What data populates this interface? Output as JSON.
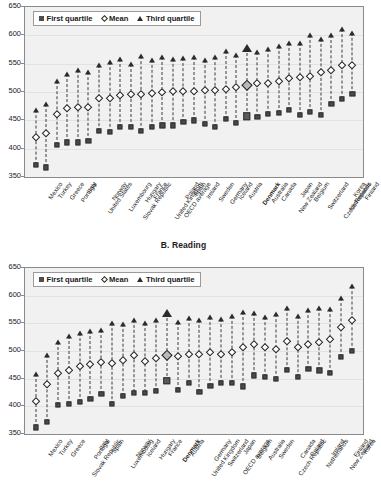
{
  "legend": {
    "first_quartile": "First quartile",
    "mean": "Mean",
    "third_quartile": "Third quartile"
  },
  "axis": {
    "ticks": [
      350,
      400,
      450,
      500,
      550,
      600,
      650
    ],
    "min": 350,
    "max": 650
  },
  "highlight_country": "Denmark",
  "chart_data": [
    {
      "type": "scatter",
      "title": "",
      "panel": "A",
      "xlabel": "",
      "ylabel": "",
      "ylim": [
        350,
        650
      ],
      "grid": true,
      "legend_position": "top-left",
      "categories": [
        "Mexico",
        "Turkey",
        "Greece",
        "Portugal",
        "Italy",
        "United States",
        "Norway",
        "Luxembourg",
        "Slovak Republic",
        "Hungary",
        "France",
        "United Kingdom",
        "OECD average",
        "Poland",
        "Spain",
        "Ireland",
        "Sweden",
        "Germany",
        "Iceland",
        "Austria",
        "Denmark",
        "Australia",
        "Canada",
        "New Zealand",
        "Japan",
        "Belgium",
        "Switzerland",
        "Czech Republic",
        "Netherlands",
        "Korea",
        "Finland"
      ],
      "series": [
        {
          "name": "First quartile",
          "values": [
            372,
            367,
            406,
            411,
            411,
            413,
            431,
            429,
            438,
            439,
            432,
            439,
            441,
            441,
            447,
            450,
            444,
            438,
            452,
            445,
            457,
            456,
            462,
            463,
            468,
            460,
            465,
            460,
            479,
            488,
            497
          ]
        },
        {
          "name": "Mean",
          "values": [
            420,
            428,
            461,
            471,
            473,
            474,
            490,
            490,
            495,
            496,
            496,
            498,
            500,
            501,
            502,
            502,
            503,
            504,
            505,
            509,
            512,
            516,
            516,
            520,
            524,
            526,
            528,
            535,
            538,
            547,
            548
          ]
        },
        {
          "name": "Third quartile",
          "values": [
            468,
            479,
            520,
            531,
            539,
            535,
            548,
            553,
            558,
            550,
            563,
            557,
            561,
            558,
            560,
            561,
            557,
            562,
            573,
            565,
            578,
            571,
            576,
            582,
            586,
            586,
            601,
            593,
            600,
            611,
            605
          ]
        }
      ]
    },
    {
      "type": "scatter",
      "title": "B. Reading",
      "panel": "B",
      "xlabel": "",
      "ylabel": "",
      "ylim": [
        350,
        650
      ],
      "grid": true,
      "legend_position": "top-left",
      "categories": [
        "Mexico",
        "Turkey",
        "Greece",
        "Slovak Republic",
        "Portugal",
        "Italy",
        "Spain",
        "Luxembourg",
        "Norway",
        "Iceland",
        "Hungary",
        "France",
        "Denmark",
        "Austria",
        "United Kingdom",
        "Germany",
        "Switzerland",
        "OECD average",
        "Japan",
        "Belgium",
        "Australia",
        "Sweden",
        "Czech Republic",
        "Canada",
        "Poland",
        "Netherlands",
        "Ireland",
        "New Zealand",
        "Finland",
        "Korea"
      ],
      "series": [
        {
          "name": "First quartile",
          "values": [
            362,
            372,
            402,
            404,
            408,
            414,
            422,
            405,
            419,
            425,
            425,
            428,
            446,
            429,
            442,
            426,
            437,
            443,
            443,
            436,
            456,
            453,
            450,
            466,
            453,
            467,
            465,
            461,
            489,
            500
          ]
        },
        {
          "name": "Mean",
          "values": [
            410,
            441,
            460,
            466,
            472,
            476,
            481,
            479,
            484,
            492,
            482,
            488,
            492,
            491,
            495,
            495,
            499,
            494,
            498,
            507,
            513,
            507,
            503,
            518,
            508,
            513,
            517,
            522,
            543,
            556
          ]
        },
        {
          "name": "Third quartile",
          "values": [
            458,
            492,
            517,
            528,
            532,
            537,
            538,
            551,
            549,
            556,
            551,
            556,
            569,
            553,
            560,
            556,
            562,
            558,
            563,
            570,
            569,
            561,
            566,
            577,
            563,
            575,
            578,
            576,
            596,
            617
          ]
        }
      ]
    }
  ]
}
